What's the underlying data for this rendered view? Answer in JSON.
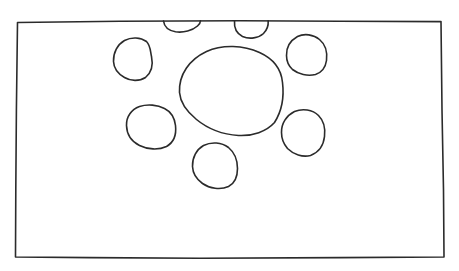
{
  "document": {
    "title": "Hand-drawn circles in a rectangle",
    "kind": "sketch",
    "medium": "pen-on-paper line drawing",
    "width": 459,
    "height": 271,
    "background_color": "#ffffff",
    "ink_color": "#2b2b2b",
    "stroke_width": 1.6,
    "text_content": ""
  },
  "frame": {
    "name": "outer rectangle",
    "corners": {
      "top_left": [
        17,
        21
      ],
      "top_right": [
        441,
        21
      ],
      "bottom_right": [
        444,
        257
      ],
      "bottom_left": [
        15,
        257
      ]
    },
    "path": "M17.5,22.5 L120,21.3 L240,20.8 L340,21.2 L441,21.6 L442,110 L443.5,190 L444,257 L340,257.6 L200,258.2 L90,257.6 L15.5,257 L15.8,190 L16.4,110 Z"
  },
  "shapes": [
    {
      "id": "circle-center-large",
      "label": "large central circle",
      "cx": 230,
      "cy": 92,
      "rx": 53,
      "ry": 44,
      "clipped": false,
      "path": "M179.5,92.5 C178.6,74.5 189.5,59.5 206.5,51.5 C222.5,44.3 243.5,45.2 259.5,52.5 C272.5,58.4 281.2,68.5 282.5,82.5 C284.2,96.5 281.5,111.5 274.5,122.5 C266.5,131.5 252.5,136.2 238.5,135.5 C222.5,134.5 207.5,128.5 196.5,119.5 C185.5,110.5 180.2,101.5 179.5,92.5 Z"
    },
    {
      "id": "circle-upper-left",
      "label": "upper-left circle",
      "cx": 133,
      "cy": 59,
      "rx": 20,
      "ry": 21,
      "clipped": false,
      "path": "M113.5,61.5 C113.2,52.5 117.5,44.5 124.5,40.5 C131.5,36.8 140.5,37.2 146.5,41.5 C150.5,45.5 150.2,50.5 151.5,56.5 C153.2,64.5 151.5,72.5 145.5,77.5 C139.5,81.5 130.5,81.2 124.5,77.5 C117.5,73.5 113.8,68.5 113.5,61.5 Z"
    },
    {
      "id": "circle-left-middle",
      "label": "left-middle circle",
      "cx": 151,
      "cy": 126,
      "rx": 25,
      "ry": 21,
      "clipped": false,
      "path": "M126.5,125.5 C126.2,116.5 131.5,109.5 139.5,106.5 C147.5,103.8 157.5,104.8 164.5,108.5 C170.5,111.5 174.5,117.5 175.5,125.5 C176.5,134.5 173.5,142.5 166.5,146.5 C158.5,150.2 147.5,149.5 139.5,145.5 C131.5,141.5 126.8,134.5 126.5,125.5 Z"
    },
    {
      "id": "circle-bottom-center",
      "label": "bottom-center circle",
      "cx": 215,
      "cy": 165,
      "rx": 23,
      "ry": 23,
      "clipped": false,
      "path": "M192.5,166.5 C192.2,157.5 196.5,149.5 203.5,145.5 C211.5,141.5 221.5,142.2 228.5,147.5 C234.5,152.5 237.5,160.5 237.5,168.5 C237.5,176.5 234.5,183.5 228.5,186.5 C220.5,190.2 209.5,188.5 202.5,183.5 C195.5,178.5 192.8,173.5 192.5,166.5 Z"
    },
    {
      "id": "circle-top-right",
      "label": "top-right circle",
      "cx": 306,
      "cy": 54,
      "rx": 20,
      "ry": 20,
      "clipped": false,
      "path": "M286.5,55.5 C286.2,47.5 290.5,40.5 297.5,36.5 C304.5,33.2 313.5,34.5 319.5,39.5 C325.5,44.5 327.5,52.5 326.5,60.5 C325.5,67.5 321.5,72.5 315.5,74.5 C307.5,76.5 298.5,74.2 292.5,69.5 C288.2,65.5 286.5,60.5 286.5,55.5 Z"
    },
    {
      "id": "circle-right-middle",
      "label": "right-middle circle",
      "cx": 303,
      "cy": 132,
      "rx": 22,
      "ry": 23,
      "clipped": false,
      "path": "M281.5,132.5 C281.2,123.5 286.5,115.5 294.5,111.5 C302.5,108.2 312.5,109.5 318.5,115.5 C323.5,120.5 325.5,128.5 324.5,136.5 C323.5,145.5 318.5,152.5 310.5,155.5 C302.5,157.5 293.5,154.5 287.5,148.5 C283.2,143.5 281.5,138.5 281.5,132.5 Z"
    },
    {
      "id": "arc-top-left-partial",
      "label": "partial circle clipped by top border (left)",
      "cx": 182,
      "cy": 21,
      "rx": 19,
      "ry": 11,
      "clipped": true,
      "path": "M163.5,21.0 C164.2,26.5 168.5,30.5 175.5,31.8 C183.5,33.0 192.5,30.5 197.5,26.0 C199.8,24.0 200.5,22.4 200.5,20.8"
    },
    {
      "id": "arc-top-right-partial",
      "label": "partial circle clipped by top border (right)",
      "cx": 251,
      "cy": 21,
      "rx": 17,
      "ry": 17,
      "clipped": true,
      "path": "M234.5,20.8 C234.0,27.5 236.5,33.5 242.5,36.5 C249.5,39.5 258.5,38.2 263.5,33.5 C267.5,29.5 268.5,25.0 268.2,20.8"
    }
  ],
  "counts": {
    "full_circles": 6,
    "partial_circles": 2,
    "large_circles": 1,
    "total_shapes": 8,
    "rectangles": 1
  }
}
